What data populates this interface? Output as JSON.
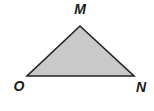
{
  "diagram": {
    "type": "triangle",
    "fill_color": "#c9c9c9",
    "stroke_color": "#222222",
    "vertices": [
      {
        "name": "M",
        "x": 80,
        "y": 26,
        "label": "M",
        "label_x": 80,
        "label_y": 14
      },
      {
        "name": "O",
        "x": 27,
        "y": 76,
        "label": "O",
        "label_x": 19,
        "label_y": 91
      },
      {
        "name": "N",
        "x": 134,
        "y": 76,
        "label": "N",
        "label_x": 141,
        "label_y": 92
      }
    ],
    "points_attr": "80,26 134,76 27,76"
  }
}
